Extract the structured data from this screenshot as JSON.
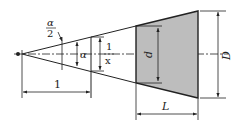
{
  "diagram": {
    "colors": {
      "line": "#222222",
      "fill": "#bdbdbd",
      "background": "#ffffff"
    },
    "labels": {
      "half_angle_num": "α",
      "half_angle_den": "2",
      "angle": "α",
      "ratio_num": "1",
      "ratio_den": "x",
      "unit_length": "1",
      "small_diameter": "d",
      "large_diameter": "D",
      "length": "L"
    }
  }
}
